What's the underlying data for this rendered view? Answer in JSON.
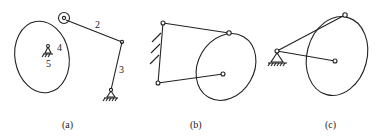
{
  "figure": {
    "subfigures": [
      {
        "id": "a",
        "caption": "(a)",
        "labels": {
          "link2": "2",
          "link3": "3",
          "cam": "4",
          "frame": "5"
        }
      },
      {
        "id": "b",
        "caption": "(b)"
      },
      {
        "id": "c",
        "caption": "(c)"
      }
    ]
  },
  "colors": {
    "stroke": "#222222",
    "background": "#ffffff"
  }
}
